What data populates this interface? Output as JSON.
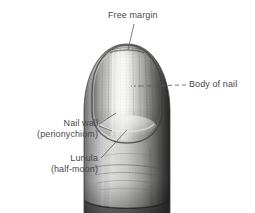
{
  "figure": {
    "background_color": "#ffffff",
    "ink_color": "#4a4a4a",
    "width": 255,
    "height": 213
  },
  "labels": {
    "free_margin": {
      "text": "Free margin",
      "lines": [
        "Free margin"
      ]
    },
    "body_of_nail": {
      "text": "Body of nail",
      "lines": [
        "Body of nail"
      ]
    },
    "nail_wall": {
      "line1": "Nail wall",
      "line2": "(perionychiom)"
    },
    "lunula": {
      "line1": "Lunula",
      "line2": "(half-moon)"
    }
  }
}
